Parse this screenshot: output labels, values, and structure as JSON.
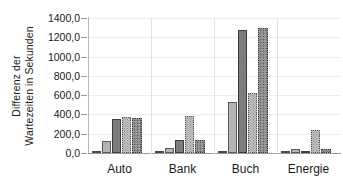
{
  "chart_data": {
    "type": "bar",
    "title": "",
    "subtitle": "",
    "xlabel": "",
    "ylabel": "Differenz der Wartezeiten in Sekunden",
    "ylabel_lines": [
      "Differenz der",
      "Wartezeiten in Sekunden"
    ],
    "categories": [
      "Auto",
      "Bank",
      "Buch",
      "Energie"
    ],
    "ylim": [
      0,
      1400
    ],
    "ytick_step": 200,
    "ytick_labels": [
      "0,0",
      "200,0",
      "400,0",
      "600,0",
      "800,0",
      "1000,0",
      "1200,0",
      "1400,0"
    ],
    "ytick_values": [
      0,
      200,
      400,
      600,
      800,
      1000,
      1200,
      1400
    ],
    "grid": true,
    "legend": "none",
    "decimal_separator": ",",
    "series": [
      {
        "name": "series-1",
        "style": "white-outline",
        "color": "#fdfdfd",
        "values": [
          10,
          8,
          20,
          10
        ]
      },
      {
        "name": "series-2",
        "style": "light-gray",
        "color": "#b4b4b4",
        "values": [
          120,
          50,
          530,
          40
        ]
      },
      {
        "name": "series-3",
        "style": "dark-gray",
        "color": "#7d7d7d",
        "values": [
          355,
          135,
          1275,
          18
        ]
      },
      {
        "name": "series-4",
        "style": "light-gray-dotted",
        "color": "#c2c2c2",
        "values": [
          375,
          380,
          625,
          235
        ]
      },
      {
        "name": "series-5",
        "style": "dark-gray-dotted",
        "color": "#8b8b8b",
        "values": [
          365,
          138,
          1295,
          45
        ]
      }
    ]
  },
  "colors": {
    "axis": "#9a9a9a",
    "grid": "#ededed",
    "text": "#1a1a1a",
    "background": "#ffffff"
  }
}
